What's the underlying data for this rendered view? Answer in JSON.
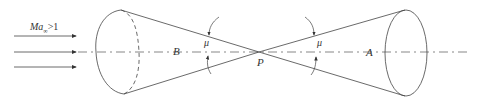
{
  "diagram": {
    "inflow_label_main": "Ma",
    "inflow_label_sub": "∞",
    "inflow_label_rel": ">1",
    "point_B": "B",
    "point_P": "P",
    "point_A": "A",
    "angle_left": "μ",
    "angle_right": "μ",
    "colors": {
      "line": "#444444",
      "background": "#ffffff"
    }
  }
}
